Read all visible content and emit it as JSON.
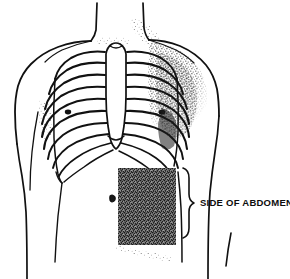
{
  "figure": {
    "type": "line-drawing-with-stipple-shading",
    "width": 290,
    "height": 279,
    "background_color": "#ffffff",
    "ink_color": "#111111",
    "stipple_color": "#1a1a1a"
  },
  "annotations": [
    {
      "id": "side-of-abdomen",
      "label": "SIDE OF ABDOMEN",
      "x": 200,
      "y": 203,
      "font_size": 9.5,
      "has_brace": true,
      "brace_x": 188,
      "brace_top": 168,
      "brace_bottom": 238
    }
  ],
  "regions": {
    "highlighted_area": {
      "name": "side-of-abdomen-shaded-region",
      "shape": "rectangle",
      "x": 118,
      "y": 168,
      "width": 58,
      "height": 77,
      "fill": "stipple-dense",
      "description": "Dense stippled rectangle marking the side of abdomen"
    },
    "shoulder_shading": {
      "name": "right-deltoid-pectoral-shading",
      "description": "Heavy stipple shading over right shoulder and pectoral region"
    }
  },
  "anatomy": {
    "ribcage": {
      "name": "rib-cage",
      "rib_pair_count": 10,
      "has_sternum": true,
      "has_xiphoid_notch": true
    },
    "torso_outline": {
      "name": "torso-outline",
      "includes": [
        "neck",
        "left-shoulder",
        "right-shoulder",
        "left-arm",
        "right-arm",
        "waist"
      ]
    },
    "landmarks": [
      {
        "name": "left-nipple",
        "x": 68,
        "y": 112
      },
      {
        "name": "right-nipple",
        "x": 162,
        "y": 112
      },
      {
        "name": "navel",
        "x": 112,
        "y": 198
      }
    ]
  },
  "colors": {
    "background": "#ffffff",
    "ink": "#111111",
    "stipple": "#1a1a1a",
    "text": "#0d0d0d"
  }
}
